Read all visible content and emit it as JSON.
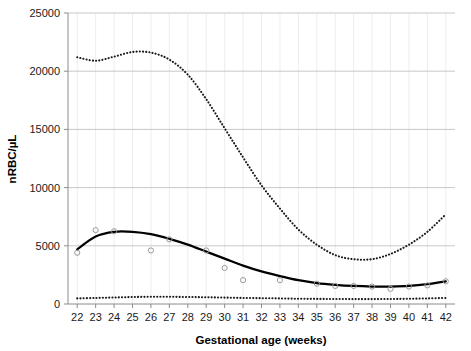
{
  "chart_data": {
    "type": "line",
    "title": "",
    "xlabel": "Gestational age (weeks)",
    "ylabel": "nRBC/µL",
    "xlim": [
      21.5,
      42.5
    ],
    "ylim": [
      0,
      25000
    ],
    "grid": "horizontal-and-faint-vertical",
    "legend": "none",
    "xticks": [
      "22",
      "23",
      "24",
      "25",
      "26",
      "27",
      "28",
      "29",
      "30",
      "31",
      "32",
      "33",
      "34",
      "35",
      "36",
      "37",
      "38",
      "39",
      "40",
      "41",
      "42"
    ],
    "yticks": [
      "0",
      "5000",
      "10000",
      "15000",
      "20000",
      "25000"
    ],
    "x": [
      22,
      23,
      24,
      25,
      26,
      27,
      28,
      29,
      30,
      31,
      32,
      33,
      34,
      35,
      36,
      37,
      38,
      39,
      40,
      41,
      42
    ],
    "series": [
      {
        "name": "upper-percentile-dotted",
        "style": "dotted",
        "color": "#1a1a1a",
        "values": [
          21200,
          20900,
          21250,
          21650,
          21600,
          21000,
          19700,
          17600,
          15100,
          12600,
          10200,
          8200,
          6400,
          5100,
          4200,
          3850,
          3850,
          4300,
          5100,
          6200,
          7700
        ]
      },
      {
        "name": "median-solid",
        "style": "solid",
        "color": "#000000",
        "values": [
          4700,
          5800,
          6200,
          6200,
          6000,
          5600,
          5100,
          4500,
          3900,
          3300,
          2800,
          2400,
          2050,
          1800,
          1650,
          1550,
          1500,
          1500,
          1550,
          1700,
          1950
        ]
      },
      {
        "name": "lower-percentile-dotted",
        "style": "dotted",
        "color": "#1a1a1a",
        "values": [
          480,
          520,
          560,
          600,
          620,
          620,
          600,
          580,
          550,
          520,
          500,
          480,
          450,
          440,
          430,
          420,
          420,
          430,
          450,
          480,
          520
        ]
      }
    ],
    "scatter": {
      "name": "observed-means",
      "marker": "open-circle",
      "color": "#9a9a9a",
      "points": [
        {
          "x": 22,
          "y": 4400
        },
        {
          "x": 23,
          "y": 6350
        },
        {
          "x": 24,
          "y": 6250
        },
        {
          "x": 26,
          "y": 4600
        },
        {
          "x": 27,
          "y": 5550
        },
        {
          "x": 29,
          "y": 4600
        },
        {
          "x": 30,
          "y": 3100
        },
        {
          "x": 31,
          "y": 2050
        },
        {
          "x": 33,
          "y": 2050
        },
        {
          "x": 35,
          "y": 1750
        },
        {
          "x": 36,
          "y": 1550
        },
        {
          "x": 37,
          "y": 1550
        },
        {
          "x": 38,
          "y": 1500
        },
        {
          "x": 39,
          "y": 1300
        },
        {
          "x": 40,
          "y": 1500
        },
        {
          "x": 41,
          "y": 1600
        },
        {
          "x": 42,
          "y": 1950
        }
      ]
    }
  }
}
